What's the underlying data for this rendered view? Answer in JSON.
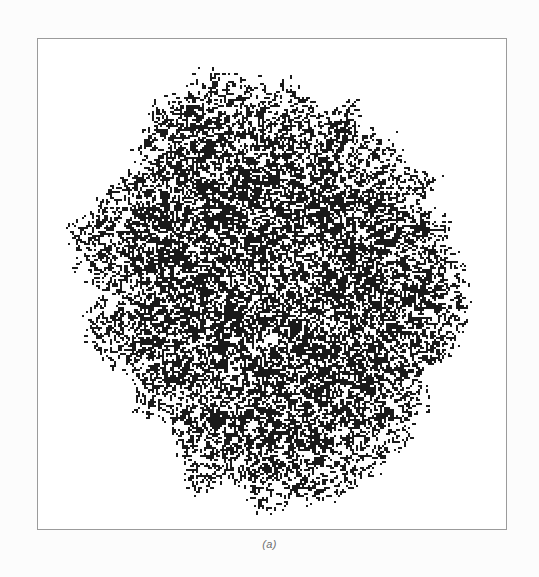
{
  "figure": {
    "caption": "(a)",
    "panel_label": "a",
    "title": "",
    "background_color": "#fcfcfc",
    "plot_background_color": "#ffffff",
    "frame_color": "#9b9b9b",
    "frame_width_px": 1,
    "caption_color": "#6e6e6e",
    "particle_color": "#1a1a1a"
  },
  "plot_area": {
    "left_px": 37,
    "top_px": 38,
    "width_px": 470,
    "height_px": 492
  },
  "chart_data": {
    "type": "scatter",
    "title": "",
    "subtitle": "",
    "xlabel": "",
    "ylabel": "",
    "legend": [],
    "grid": false,
    "axis_ticks": false,
    "structure": "on-lattice cluster of occupied sites with rough dendritic perimeter",
    "lattice_pitch_px": 2,
    "cluster_center_x_px": 272,
    "cluster_center_y_px": 287,
    "cluster_radius_x_px": 205,
    "cluster_radius_y_px": 212,
    "cluster_bbox_px": {
      "x_min": 62,
      "y_min": 68,
      "x_max": 478,
      "y_max": 508
    },
    "approx_occupied_sites": 26000,
    "interior_fill_fraction": 0.62,
    "perimeter_roughness": 0.085,
    "xlim": [
      0,
      470
    ],
    "ylim": [
      0,
      492
    ],
    "series": [
      {
        "name": "cluster sites",
        "color": "#1a1a1a",
        "marker": "square",
        "marker_size_px": 2,
        "n_points": 26000
      }
    ]
  }
}
